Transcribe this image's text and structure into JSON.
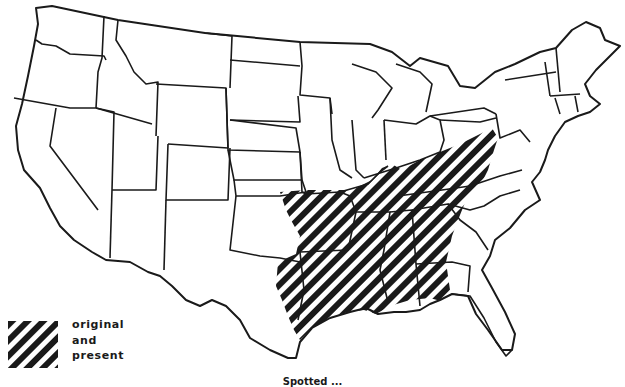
{
  "map": {
    "type": "range-map",
    "subject": "United States (lower 48) state outlines",
    "hatch_color": "#1a1a1a",
    "background": "#ffffff",
    "shaded_region": "southeastern-south-central United States (hatched)"
  },
  "legend": {
    "items": [
      {
        "pattern": "diagonal-hatch",
        "lines": [
          "original",
          "and",
          "present"
        ]
      }
    ]
  },
  "caption": "Spotted ..."
}
